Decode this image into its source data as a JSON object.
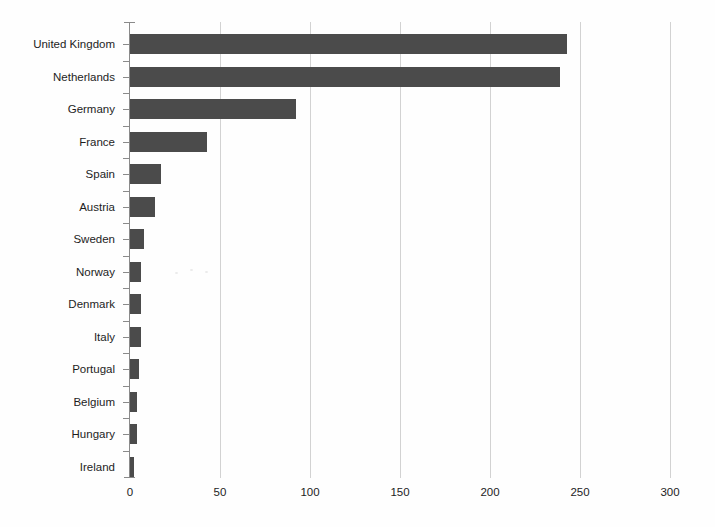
{
  "chart_data": {
    "type": "bar",
    "orientation": "horizontal",
    "title": "",
    "subtitle": "",
    "xlabel": "",
    "ylabel": "",
    "categories": [
      "United Kingdom",
      "Netherlands",
      "Germany",
      "France",
      "Spain",
      "Austria",
      "Sweden",
      "Norway",
      "Denmark",
      "Italy",
      "Portugal",
      "Belgium",
      "Hungary",
      "Ireland"
    ],
    "values": [
      243,
      239,
      92,
      43,
      17,
      14,
      8,
      6,
      6,
      6,
      5,
      4,
      4,
      2
    ],
    "xlim": [
      0,
      300
    ],
    "xticks": [
      0,
      50,
      100,
      150,
      200,
      250,
      300
    ],
    "xtick_labels": [
      "0",
      "50",
      "100",
      "150",
      "200",
      "250",
      "300"
    ],
    "grid": true,
    "grid_axis": "x",
    "legend": false,
    "legend_position": "none",
    "bar_color": "#4b4b4b",
    "grid_color": "#d2d2d2",
    "axis_color": "#8a8a8a",
    "background_color": "#ffffff"
  }
}
